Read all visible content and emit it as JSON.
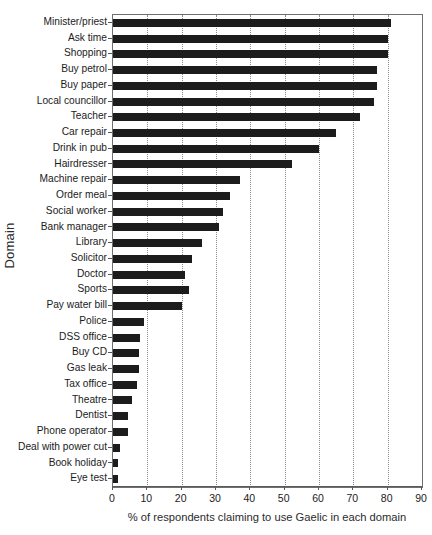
{
  "chart_data": {
    "type": "bar",
    "orientation": "horizontal",
    "title": "",
    "xlabel": "% of respondents claiming to use Gaelic in each domain",
    "ylabel": "Domain",
    "xlim": [
      0,
      90
    ],
    "xticks": [
      0,
      10,
      20,
      30,
      40,
      50,
      60,
      70,
      80,
      90
    ],
    "grid": "vertical-dotted",
    "legend": "none",
    "bar_color": "#1c1c1c",
    "categories": [
      "Minister/priest",
      "Ask time",
      "Shopping",
      "Buy petrol",
      "Buy paper",
      "Local councillor",
      "Teacher",
      "Car repair",
      "Drink in pub",
      "Hairdresser",
      "Machine repair",
      "Order meal",
      "Social worker",
      "Bank manager",
      "Library",
      "Solicitor",
      "Doctor",
      "Sports",
      "Pay water bill",
      "Police",
      "DSS office",
      "Buy CD",
      "Gas leak",
      "Tax office",
      "Theatre",
      "Dentist",
      "Phone operator",
      "Deal with power cut",
      "Book holiday",
      "Eye test"
    ],
    "values": [
      81,
      80,
      80,
      77,
      77,
      76,
      72,
      65,
      60,
      52,
      37,
      34,
      32,
      31,
      26,
      23,
      21,
      22,
      20,
      9,
      8,
      7.5,
      7.5,
      7,
      5.5,
      4.5,
      4.5,
      2,
      1.5,
      1.5
    ]
  }
}
